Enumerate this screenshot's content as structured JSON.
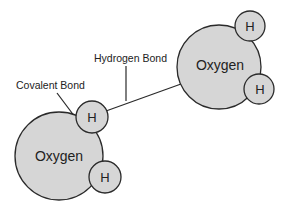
{
  "diagram": {
    "labels": {
      "hydrogen_bond": "Hydrogen Bond",
      "covalent_bond": "Covalent Bond"
    },
    "molecules": [
      {
        "oxygen": {
          "label": "Oxygen",
          "cx": 59,
          "cy": 156,
          "r": 44
        },
        "hydrogens": [
          {
            "label": "H",
            "cx": 92,
            "cy": 117,
            "r": 16
          },
          {
            "label": "H",
            "cx": 105,
            "cy": 177,
            "r": 16
          }
        ]
      },
      {
        "oxygen": {
          "label": "Oxygen",
          "cx": 219,
          "cy": 67,
          "r": 42
        },
        "hydrogens": [
          {
            "label": "H",
            "cx": 250,
            "cy": 26,
            "r": 15
          },
          {
            "label": "H",
            "cx": 259,
            "cy": 89,
            "r": 15
          }
        ]
      }
    ],
    "colors": {
      "atom_fill": "#d6d6d6",
      "stroke": "#2a2a2a",
      "text": "#222222"
    }
  }
}
